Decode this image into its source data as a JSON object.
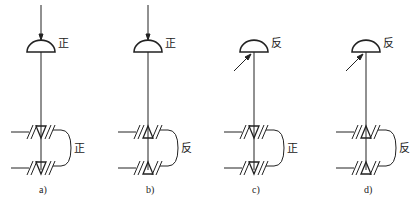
{
  "panels": [
    {
      "caption": "a)",
      "cx": 41,
      "load": "top",
      "dome_label": "正",
      "bearing": "down",
      "pair_label": "正"
    },
    {
      "caption": "b)",
      "cx": 148,
      "load": "top",
      "dome_label": "正",
      "bearing": "up",
      "pair_label": "反"
    },
    {
      "caption": "c)",
      "cx": 254,
      "load": "side",
      "dome_label": "反",
      "bearing": "down",
      "pair_label": "正"
    },
    {
      "caption": "d)",
      "cx": 366,
      "load": "side",
      "dome_label": "反",
      "bearing": "up",
      "pair_label": "反"
    }
  ],
  "colors": {
    "stroke": "#222222",
    "background": "#ffffff"
  }
}
